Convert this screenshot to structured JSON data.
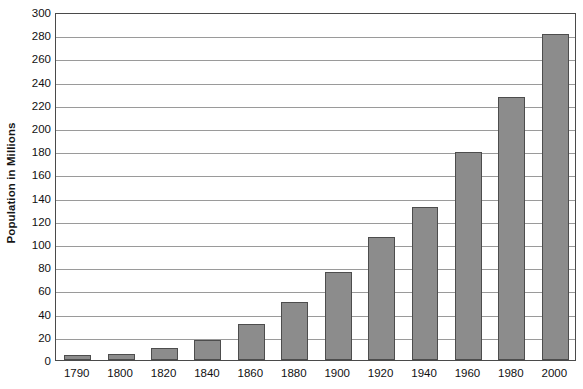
{
  "chart_data": {
    "type": "bar",
    "title": "",
    "xlabel": "",
    "ylabel": "Population in Millions",
    "categories": [
      "1790",
      "1800",
      "1820",
      "1840",
      "1860",
      "1880",
      "1900",
      "1920",
      "1940",
      "1960",
      "1980",
      "2000"
    ],
    "values": [
      4,
      5,
      10,
      17,
      31,
      50,
      76,
      106,
      132,
      179,
      227,
      281
    ],
    "ylim": [
      0,
      300
    ],
    "ytick_step": 20,
    "yticks": [
      0,
      20,
      40,
      60,
      80,
      100,
      120,
      140,
      160,
      180,
      200,
      220,
      240,
      260,
      280,
      300
    ],
    "ytick_labels": [
      "0",
      "20",
      "40",
      "60",
      "80",
      "100",
      "120",
      "140",
      "160",
      "180",
      "200",
      "220",
      "240",
      "260",
      "280",
      "300"
    ],
    "grid": true,
    "grid_axis": "y",
    "legend": false,
    "legend_position": "none",
    "series": [
      {
        "name": "Population",
        "values": [
          4,
          5,
          10,
          17,
          31,
          50,
          76,
          106,
          132,
          179,
          227,
          281
        ]
      }
    ],
    "colors": {
      "bar_fill": "#8c8c8c",
      "bar_border": "#4d4d4d",
      "gridline": "#9a9a9a",
      "axis": "#4a4a4a",
      "text": "#111111",
      "background": "#ffffff"
    }
  }
}
